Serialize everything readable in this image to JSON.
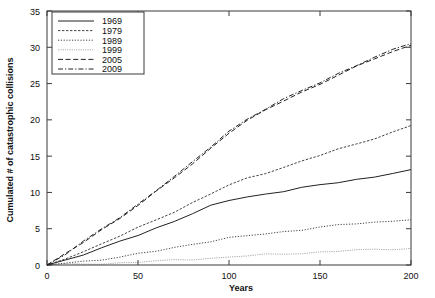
{
  "chart_data": {
    "type": "line",
    "title": "",
    "xlabel": "Years",
    "ylabel": "Cumulated # of catastrophic collisions",
    "xlim": [
      0,
      200
    ],
    "ylim": [
      0,
      35
    ],
    "xticks": [
      0,
      50,
      100,
      150,
      200
    ],
    "yticks": [
      0,
      5,
      10,
      15,
      20,
      25,
      30,
      35
    ],
    "grid": false,
    "legend_position": "top-left",
    "x": [
      0,
      10,
      20,
      30,
      40,
      50,
      60,
      70,
      80,
      90,
      100,
      110,
      120,
      130,
      140,
      150,
      160,
      170,
      180,
      190,
      200
    ],
    "series": [
      {
        "name": "1969",
        "style": "solid",
        "values": [
          0,
          0.7,
          1.5,
          2.3,
          3.2,
          4.1,
          5.1,
          6.1,
          7.1,
          8.1,
          8.9,
          9.4,
          9.8,
          10.2,
          10.6,
          11.0,
          11.4,
          11.8,
          12.2,
          12.6,
          13.0
        ]
      },
      {
        "name": "1979",
        "style": "fine-dash",
        "values": [
          0,
          0.9,
          1.9,
          2.9,
          4.0,
          5.1,
          6.2,
          7.4,
          8.6,
          9.8,
          11.0,
          11.9,
          12.7,
          13.5,
          14.3,
          15.1,
          15.9,
          16.7,
          17.5,
          18.3,
          19.2
        ]
      },
      {
        "name": "1989",
        "style": "dotted",
        "values": [
          0,
          0.25,
          0.5,
          0.8,
          1.1,
          1.5,
          1.9,
          2.4,
          2.9,
          3.3,
          3.7,
          4.0,
          4.3,
          4.6,
          4.9,
          5.2,
          5.45,
          5.7,
          5.9,
          6.1,
          6.3
        ]
      },
      {
        "name": "1999",
        "style": "faint-solid",
        "values": [
          0,
          0.05,
          0.12,
          0.2,
          0.3,
          0.4,
          0.52,
          0.65,
          0.8,
          0.95,
          1.1,
          1.25,
          1.4,
          1.52,
          1.65,
          1.78,
          1.9,
          2.02,
          2.12,
          2.22,
          2.3
        ]
      },
      {
        "name": "2005",
        "style": "dash",
        "values": [
          0,
          1.5,
          3.1,
          4.8,
          6.5,
          8.3,
          10.1,
          12.0,
          13.9,
          16.1,
          18.3,
          19.9,
          21.3,
          22.6,
          23.8,
          25.0,
          26.2,
          27.3,
          28.4,
          29.4,
          30.3
        ]
      },
      {
        "name": "2009",
        "style": "dash-dot",
        "values": [
          0,
          1.5,
          3.2,
          4.9,
          6.6,
          8.4,
          10.3,
          12.2,
          14.1,
          16.3,
          18.5,
          20.1,
          21.5,
          22.8,
          24.0,
          25.2,
          26.4,
          27.5,
          28.6,
          29.6,
          30.6
        ]
      }
    ],
    "legend": [
      "1969",
      "1979",
      "1989",
      "1999",
      "2005",
      "2009"
    ]
  },
  "colors": {
    "axis": "#3a3a3a",
    "line": "#222222",
    "background": "#ffffff"
  }
}
